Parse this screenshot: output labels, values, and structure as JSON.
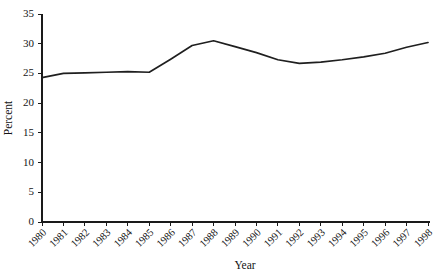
{
  "chart_data": {
    "type": "line",
    "title": "",
    "xlabel": "Year",
    "ylabel": "Percent",
    "categories": [
      "1980",
      "1981",
      "1982",
      "1983",
      "1984",
      "1985",
      "1986",
      "1987",
      "1988",
      "1989",
      "1990",
      "1991",
      "1992",
      "1993",
      "1994",
      "1995",
      "1996",
      "1997",
      "1998"
    ],
    "x": [
      1980,
      1981,
      1982,
      1983,
      1984,
      1985,
      1986,
      1987,
      1988,
      1989,
      1990,
      1991,
      1992,
      1993,
      1994,
      1995,
      1996,
      1997,
      1998
    ],
    "values": [
      24.3,
      25.0,
      25.1,
      25.2,
      25.3,
      25.2,
      27.4,
      29.7,
      30.5,
      29.5,
      28.5,
      27.3,
      26.7,
      26.9,
      27.3,
      27.8,
      28.4,
      29.4,
      30.2
    ],
    "series": [
      {
        "name": "Percent",
        "values": [
          24.3,
          25.0,
          25.1,
          25.2,
          25.3,
          25.2,
          27.4,
          29.7,
          30.5,
          29.5,
          28.5,
          27.3,
          26.7,
          26.9,
          27.3,
          27.8,
          28.4,
          29.4,
          30.2
        ],
        "color": "#1f1f1f"
      }
    ],
    "xlim": [
      1980,
      1998
    ],
    "ylim": [
      0,
      35
    ],
    "yticks": [
      0,
      5,
      10,
      15,
      20,
      25,
      30,
      35
    ],
    "ytick_labels": [
      "0",
      "5",
      "10",
      "15",
      "20",
      "25",
      "30",
      "35"
    ],
    "xticks": [
      1980,
      1981,
      1982,
      1983,
      1984,
      1985,
      1986,
      1987,
      1988,
      1989,
      1990,
      1991,
      1992,
      1993,
      1994,
      1995,
      1996,
      1997,
      1998
    ],
    "xtick_labels": [
      "1980",
      "1981",
      "1982",
      "1983",
      "1984",
      "1985",
      "1986",
      "1987",
      "1988",
      "1989",
      "1990",
      "1991",
      "1992",
      "1993",
      "1994",
      "1995",
      "1996",
      "1997",
      "1998"
    ],
    "xtick_rotation": 45,
    "grid": false,
    "legend": null,
    "legend_position": "none",
    "spines": [
      "left",
      "bottom"
    ],
    "tick_direction": "out",
    "background_color": "#ffffff",
    "line_color": "#1f1f1f",
    "annotations": []
  },
  "figure": {
    "cropped_title_fragment": ""
  }
}
